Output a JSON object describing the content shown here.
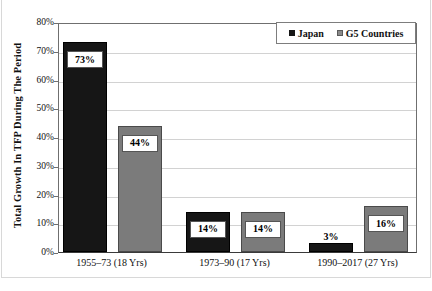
{
  "chart_data": {
    "type": "bar",
    "title": "",
    "subtitle": "",
    "xlabel": "",
    "ylabel": "Total Growth In TFP During The Period",
    "categories": [
      "1955–73 (18 Yrs)",
      "1973–90 (17 Yrs)",
      "1990–2017 (27 Yrs)"
    ],
    "series": [
      {
        "name": "Japan",
        "color": "#161616",
        "values": [
          73,
          14,
          3
        ],
        "labels": [
          "73%",
          "14%",
          "3%"
        ]
      },
      {
        "name": "G5 Countries",
        "color": "#7b7b7b",
        "values": [
          44,
          14,
          16
        ],
        "labels": [
          "44%",
          "14%",
          "16%"
        ]
      }
    ],
    "ylim": [
      0,
      80
    ],
    "ytick_values": [
      80,
      70,
      60,
      50,
      40,
      30,
      20,
      10,
      0
    ],
    "ytick_labels": [
      "80%",
      "70%",
      "60%",
      "50%",
      "40%",
      "30%",
      "20%",
      "10%",
      "0%"
    ],
    "grid": true,
    "legend_position": "top-right-inside",
    "value_suffix": "%"
  },
  "legend": {
    "entries": [
      {
        "label": "Japan",
        "swatch": "japan-swatch"
      },
      {
        "label": "G5 Countries",
        "swatch": "g5-swatch"
      }
    ]
  },
  "colors": {
    "japan": "#161616",
    "g5": "#7b7b7b",
    "grid": "#d2d2d2",
    "axis": "#3a3a3a",
    "background": "#ffffff"
  }
}
